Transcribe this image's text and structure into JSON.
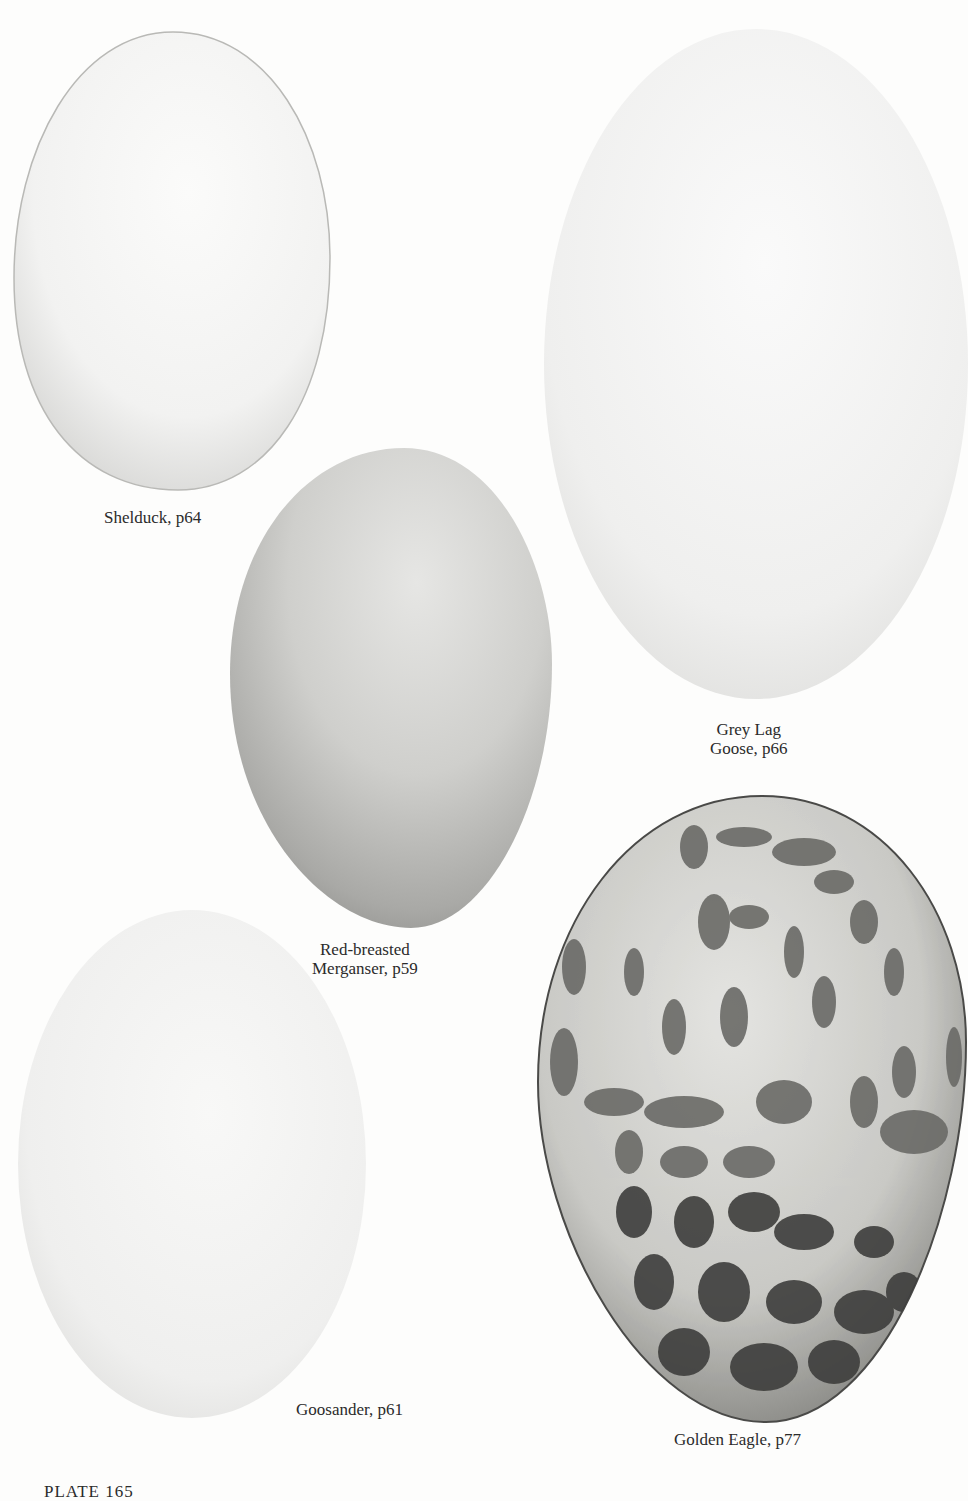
{
  "plate": {
    "label": "PLATE 165",
    "background_color": "#fdfdfc"
  },
  "eggs": [
    {
      "name": "shelduck",
      "caption_lines": [
        "Shelduck, p64"
      ],
      "shell": "plain white",
      "color": "#f5f5f4"
    },
    {
      "name": "grey-lag-goose",
      "caption_lines": [
        "Grey Lag",
        "Goose, p66"
      ],
      "shell": "plain white",
      "color": "#f1f1f0"
    },
    {
      "name": "red-breasted-merganser",
      "caption_lines": [
        "Red-breasted",
        "Merganser, p59"
      ],
      "shell": "plain grey-buff",
      "color": "#c9c9c6"
    },
    {
      "name": "goosander",
      "caption_lines": [
        "Goosander, p61"
      ],
      "shell": "plain creamy white",
      "color": "#f0f0ef"
    },
    {
      "name": "golden-eagle",
      "caption_lines": [
        "Golden Eagle, p77"
      ],
      "shell": "heavily blotched",
      "color": "#cfcfcb",
      "blotch_color": "#555555"
    }
  ]
}
